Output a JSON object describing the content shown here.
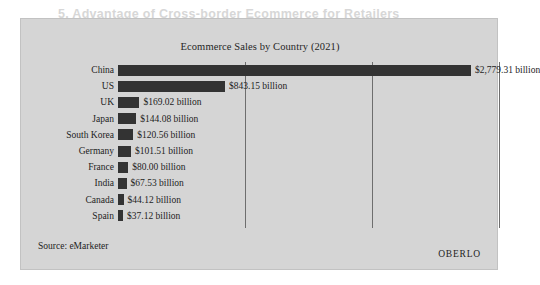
{
  "figure": {
    "title": "Ecommerce Sales by Country (2021)",
    "source": "Source: eMarketer",
    "brand": "OBERLO",
    "panel_color": "#d5d5d5",
    "bar_color": "#333333",
    "gridline_color": "#6e6e6e"
  },
  "background_bleed": {
    "heading": "5. Advantage of Cross-border Ecommerce for Retailers"
  },
  "chart_data": {
    "type": "bar",
    "orientation": "horizontal",
    "title": "Ecommerce Sales by Country (2021)",
    "xlabel": "",
    "ylabel": "",
    "unit": "billion USD",
    "grid": true,
    "gridline_values": [
      1000,
      2000,
      3000
    ],
    "xlim": [
      0,
      3000
    ],
    "legend": null,
    "categories": [
      "China",
      "US",
      "UK",
      "Japan",
      "South Korea",
      "Germany",
      "France",
      "India",
      "Canada",
      "Spain"
    ],
    "values": [
      2779.31,
      843.15,
      169.02,
      144.08,
      120.56,
      101.51,
      80.0,
      67.53,
      44.12,
      37.12
    ],
    "data_labels": [
      "$2,779.31 billion",
      "$843.15 billion",
      "$169.02 billion",
      "$144.08 billion",
      "$120.56 billion",
      "$101.51 billion",
      "$80.00 billion",
      "$67.53 billion",
      "$44.12 billion",
      "$37.12 billion"
    ],
    "source": "eMarketer"
  }
}
